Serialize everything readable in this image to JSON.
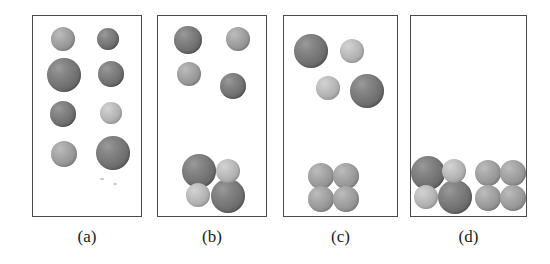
{
  "figure": {
    "width": 550,
    "height": 264,
    "background": "#ffffff",
    "border_color": "#4a4a4a",
    "sphere_colors": {
      "dark": "#757575",
      "mid": "#9a9a9a",
      "light": "#b3b3b3"
    }
  },
  "panels": [
    {
      "id": "a",
      "label": "(a)",
      "box": {
        "x": 32,
        "y": 15,
        "w": 110,
        "h": 202
      },
      "label_pos": {
        "x": 32,
        "y": 228,
        "w": 110
      },
      "spheres": [
        {
          "cx": 62,
          "cy": 38,
          "r": 12,
          "shade": "mid"
        },
        {
          "cx": 107,
          "cy": 38,
          "r": 11,
          "shade": "dark"
        },
        {
          "cx": 63,
          "cy": 74,
          "r": 17,
          "shade": "dark"
        },
        {
          "cx": 110,
          "cy": 73,
          "r": 13,
          "shade": "dark"
        },
        {
          "cx": 62,
          "cy": 113,
          "r": 13,
          "shade": "dark"
        },
        {
          "cx": 110,
          "cy": 112,
          "r": 11,
          "shade": "light"
        },
        {
          "cx": 63,
          "cy": 153,
          "r": 13,
          "shade": "mid"
        },
        {
          "cx": 112,
          "cy": 152,
          "r": 17,
          "shade": "dark"
        }
      ]
    },
    {
      "id": "b",
      "label": "(b)",
      "box": {
        "x": 157,
        "y": 15,
        "w": 110,
        "h": 202
      },
      "label_pos": {
        "x": 157,
        "y": 228,
        "w": 110
      },
      "spheres": [
        {
          "cx": 187,
          "cy": 39,
          "r": 14,
          "shade": "dark"
        },
        {
          "cx": 237,
          "cy": 38,
          "r": 12,
          "shade": "mid"
        },
        {
          "cx": 188,
          "cy": 73,
          "r": 12,
          "shade": "mid"
        },
        {
          "cx": 232,
          "cy": 85,
          "r": 13,
          "shade": "dark"
        },
        {
          "cx": 198,
          "cy": 170,
          "r": 17,
          "shade": "dark"
        },
        {
          "cx": 227,
          "cy": 170,
          "r": 12,
          "shade": "light"
        },
        {
          "cx": 197,
          "cy": 194,
          "r": 12,
          "shade": "light"
        },
        {
          "cx": 227,
          "cy": 195,
          "r": 17,
          "shade": "dark"
        }
      ]
    },
    {
      "id": "c",
      "label": "(c)",
      "box": {
        "x": 283,
        "y": 15,
        "w": 115,
        "h": 202
      },
      "label_pos": {
        "x": 283,
        "y": 228,
        "w": 115
      },
      "spheres": [
        {
          "cx": 310,
          "cy": 50,
          "r": 17,
          "shade": "dark"
        },
        {
          "cx": 351,
          "cy": 50,
          "r": 12,
          "shade": "light"
        },
        {
          "cx": 327,
          "cy": 87,
          "r": 12,
          "shade": "light"
        },
        {
          "cx": 366,
          "cy": 90,
          "r": 17,
          "shade": "dark"
        },
        {
          "cx": 320,
          "cy": 175,
          "r": 13,
          "shade": "mid"
        },
        {
          "cx": 345,
          "cy": 175,
          "r": 13,
          "shade": "mid"
        },
        {
          "cx": 320,
          "cy": 198,
          "r": 13,
          "shade": "mid"
        },
        {
          "cx": 345,
          "cy": 198,
          "r": 13,
          "shade": "mid"
        }
      ]
    },
    {
      "id": "d",
      "label": "(d)",
      "box": {
        "x": 410,
        "y": 15,
        "w": 117,
        "h": 202
      },
      "label_pos": {
        "x": 410,
        "y": 228,
        "w": 117
      },
      "spheres": [
        {
          "cx": 427,
          "cy": 172,
          "r": 17,
          "shade": "dark"
        },
        {
          "cx": 453,
          "cy": 170,
          "r": 12,
          "shade": "light"
        },
        {
          "cx": 425,
          "cy": 196,
          "r": 12,
          "shade": "light"
        },
        {
          "cx": 454,
          "cy": 196,
          "r": 17,
          "shade": "dark"
        },
        {
          "cx": 487,
          "cy": 172,
          "r": 13,
          "shade": "mid"
        },
        {
          "cx": 512,
          "cy": 172,
          "r": 13,
          "shade": "mid"
        },
        {
          "cx": 487,
          "cy": 197,
          "r": 13,
          "shade": "mid"
        },
        {
          "cx": 512,
          "cy": 197,
          "r": 13,
          "shade": "mid"
        }
      ]
    }
  ],
  "specks": [
    {
      "x": 100,
      "y": 178
    },
    {
      "x": 113,
      "y": 183
    }
  ]
}
